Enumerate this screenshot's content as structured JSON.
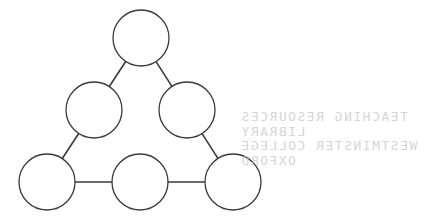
{
  "diagram": {
    "stroke_color": "#3a3a3a",
    "fill_color": "#ffffff",
    "radius": 28,
    "nodes": [
      {
        "id": "top",
        "cx": 141,
        "cy": 38
      },
      {
        "id": "mid-left",
        "cx": 94,
        "cy": 110
      },
      {
        "id": "mid-right",
        "cx": 187,
        "cy": 110
      },
      {
        "id": "bottom-left",
        "cx": 47,
        "cy": 182
      },
      {
        "id": "bottom-middle",
        "cx": 140,
        "cy": 182
      },
      {
        "id": "bottom-right",
        "cx": 233,
        "cy": 182
      }
    ],
    "edges": [
      [
        "top",
        "mid-left"
      ],
      [
        "top",
        "mid-right"
      ],
      [
        "mid-left",
        "bottom-left"
      ],
      [
        "mid-right",
        "bottom-right"
      ],
      [
        "bottom-left",
        "bottom-middle"
      ],
      [
        "bottom-middle",
        "bottom-right"
      ]
    ]
  },
  "stamp": {
    "line1": "TEACHING RESOURCES",
    "line2": "LIBRARY",
    "line3": "WESTMINSTER COLLEGE",
    "line4": "OXFORD",
    "color": "#c9c9c9"
  }
}
